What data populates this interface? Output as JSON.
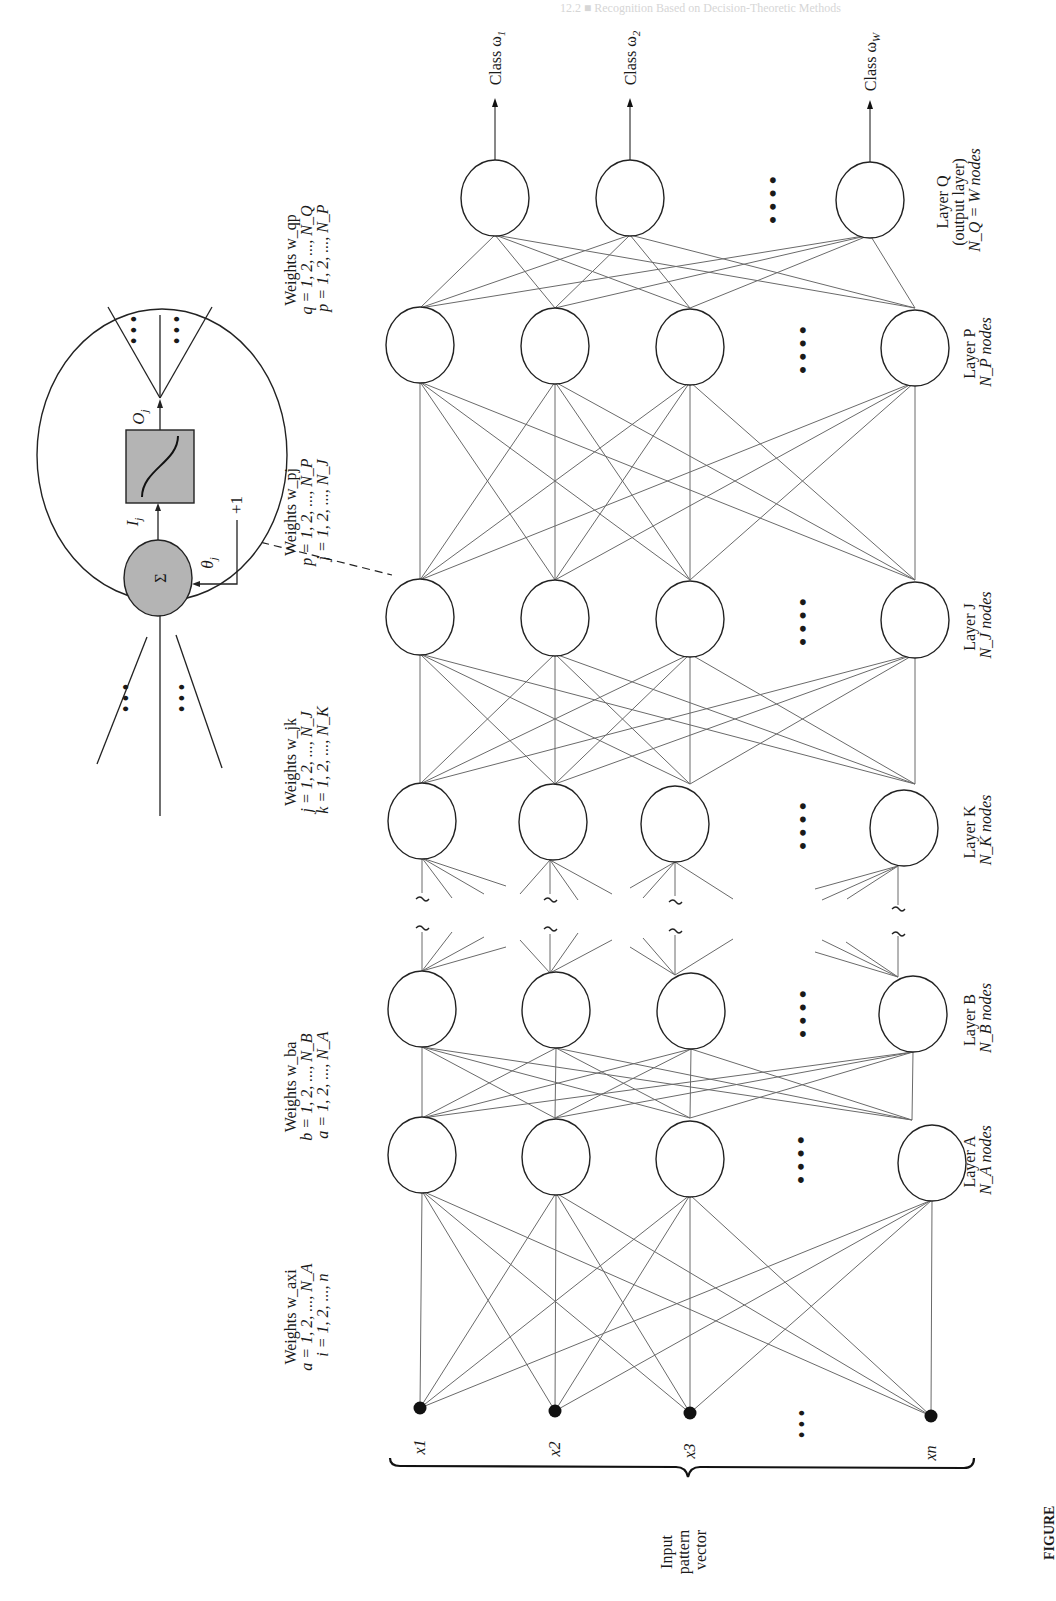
{
  "figure": {
    "orientation": "rotated-90-ccw",
    "header_bleed": "12.2 ■ Recognition Based on Decision-Theoretic Methods",
    "caption_cutoff": "FIGURE"
  },
  "neuron_detail": {
    "sum_symbol": "Σ",
    "input_label": "I",
    "input_sub": "j",
    "output_label": "O",
    "output_sub": "j",
    "bias_label": "θ",
    "bias_sub": "j",
    "bias_value": "+1",
    "ellipsis": "• • •"
  },
  "outputs": [
    {
      "label": "Class ω",
      "sub": "1"
    },
    {
      "label": "Class ω",
      "sub": "2"
    },
    {
      "label": "Class ω",
      "sub": "W"
    }
  ],
  "layers": [
    {
      "id": "Q",
      "line1": "Layer Q",
      "line2": "(output layer)",
      "line3": "N_Q = W nodes"
    },
    {
      "id": "P",
      "line1": "Layer P",
      "line2": "N_P nodes"
    },
    {
      "id": "J",
      "line1": "Layer J",
      "line2": "N_J nodes"
    },
    {
      "id": "K",
      "line1": "Layer K",
      "line2": "N_K nodes"
    },
    {
      "id": "B",
      "line1": "Layer B",
      "line2": "N_B nodes"
    },
    {
      "id": "A",
      "line1": "Layer A",
      "line2": "N_A nodes"
    }
  ],
  "weights": [
    {
      "title": "Weights w_qp",
      "l1": "q = 1, 2, ..., N_Q",
      "l2": "p = 1, 2, ..., N_P"
    },
    {
      "title": "Weights w_pj",
      "l1": "p = 1, 2, ..., N_P",
      "l2": "j = 1, 2, ..., N_J"
    },
    {
      "title": "Weights w_jk",
      "l1": "j = 1, 2, ..., N_J",
      "l2": "k = 1, 2, ..., N_K"
    },
    {
      "title": "Weights w_ba",
      "l1": "b = 1, 2, ..., N_B",
      "l2": "a = 1, 2, ..., N_A"
    },
    {
      "title": "Weights w_axi",
      "l1": "a = 1, 2, ..., N_A",
      "l2": "i = 1, 2, ..., n"
    }
  ],
  "inputs": {
    "nodes": [
      "x1",
      "x2",
      "x3",
      "xn"
    ],
    "ellipsis": "• • •",
    "group_label_1": "Input",
    "group_label_2": "pattern",
    "group_label_3": "vector"
  },
  "layer_ellipsis": "• • • •",
  "colors": {
    "line": "#6a6a6a",
    "node_stroke": "#222222",
    "neuron_fill": "#b4b4b4",
    "text": "#1a1a1a"
  }
}
